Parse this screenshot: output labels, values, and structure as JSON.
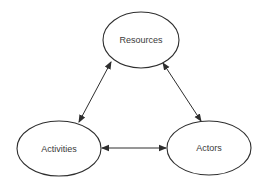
{
  "diagram": {
    "type": "triangle-relationship",
    "colors": {
      "stroke": "#2e2e2e",
      "text": "#3a3a3a",
      "background": "#ffffff"
    },
    "nodes": [
      {
        "id": "resources",
        "label": "Resources",
        "shape": "ellipse",
        "cx": 141,
        "cy": 40,
        "rx": 38,
        "ry": 28
      },
      {
        "id": "activities",
        "label": "Activities",
        "shape": "ellipse",
        "cx": 59,
        "cy": 148.5,
        "rx": 42,
        "ry": 27.5
      },
      {
        "id": "actors",
        "label": "Actors",
        "shape": "ellipse",
        "cx": 209,
        "cy": 148,
        "rx": 42,
        "ry": 27
      }
    ],
    "edges": [
      {
        "from": "resources",
        "to": "activities",
        "direction": "bidirectional"
      },
      {
        "from": "resources",
        "to": "actors",
        "direction": "bidirectional"
      },
      {
        "from": "activities",
        "to": "actors",
        "direction": "bidirectional"
      }
    ]
  }
}
